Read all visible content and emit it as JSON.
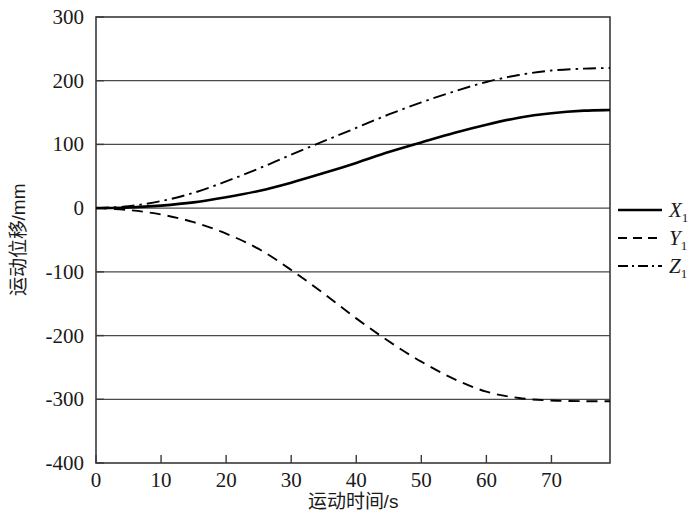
{
  "chart_data": {
    "type": "line",
    "title": "",
    "xlabel": "运动时间/s",
    "ylabel": "运动位移/mm",
    "xlim": [
      0,
      79
    ],
    "ylim": [
      -400,
      300
    ],
    "xticks": [
      "0",
      "10",
      "20",
      "30",
      "40",
      "50",
      "60",
      "70"
    ],
    "xtick_values": [
      0,
      10,
      20,
      30,
      40,
      50,
      60,
      70
    ],
    "yticks": [
      "300",
      "200",
      "100",
      "0",
      "-100",
      "-200",
      "-300",
      "-400"
    ],
    "ytick_values": [
      300,
      200,
      100,
      0,
      -100,
      -200,
      -300,
      -400
    ],
    "grid": "horizontal",
    "legend_position": "right-middle",
    "x": [
      0,
      5,
      10,
      15,
      20,
      25,
      30,
      35,
      40,
      45,
      50,
      55,
      60,
      65,
      70,
      75,
      79
    ],
    "series": [
      {
        "name": "X",
        "subscript": "1",
        "label": "X1",
        "style": "solid",
        "color": "#000000",
        "values": [
          0,
          1,
          4,
          9,
          17,
          27,
          40,
          55,
          71,
          88,
          103,
          118,
          131,
          142,
          149,
          153,
          154
        ]
      },
      {
        "name": "Y",
        "subscript": "1",
        "label": "Y1",
        "style": "dashed",
        "color": "#000000",
        "values": [
          0,
          -3,
          -10,
          -22,
          -40,
          -64,
          -97,
          -134,
          -173,
          -209,
          -241,
          -268,
          -288,
          -298,
          -302,
          -303,
          -303
        ]
      },
      {
        "name": "Z",
        "subscript": "1",
        "label": "Z1",
        "style": "dashdot",
        "color": "#000000",
        "values": [
          0,
          3,
          11,
          24,
          42,
          62,
          84,
          105,
          126,
          147,
          166,
          183,
          198,
          209,
          216,
          219,
          220
        ]
      }
    ]
  },
  "axes": {
    "x_axis_label": "运动时间/s",
    "y_axis_label": "运动位移/mm"
  },
  "legend": {
    "items": [
      {
        "base": "X",
        "sub": "1",
        "style": "solid"
      },
      {
        "base": "Y",
        "sub": "1",
        "style": "dashed"
      },
      {
        "base": "Z",
        "sub": "1",
        "style": "dashdot"
      }
    ]
  }
}
